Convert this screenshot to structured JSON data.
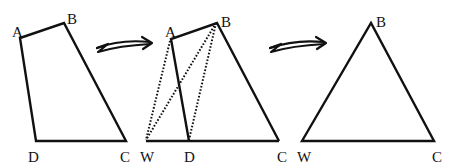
{
  "diagram": {
    "panels": [
      {
        "name": "quadrilateral",
        "labels": {
          "A": "A",
          "B": "B",
          "C": "C",
          "D": "D"
        },
        "shaded": true
      },
      {
        "name": "construction",
        "labels": {
          "A": "A",
          "B": "B",
          "C": "C",
          "D": "D",
          "W": "W"
        },
        "dotted_segments": [
          "AW",
          "BW",
          "BD"
        ],
        "shaded": false
      },
      {
        "name": "triangle",
        "labels": {
          "B": "B",
          "W": "W",
          "C": "C"
        },
        "shaded": true
      }
    ],
    "arrows": [
      "arrow-1",
      "arrow-2"
    ],
    "colors": {
      "stroke": "#111111",
      "hatch": "#bbbbbb",
      "background": "#ffffff"
    }
  }
}
